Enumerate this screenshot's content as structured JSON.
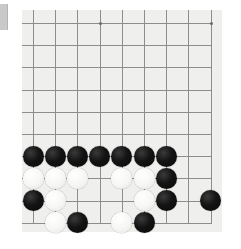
{
  "app": {
    "title": "Go board position",
    "kind": "go-board-image"
  },
  "edge_mark": {
    "name": "left-edge-marker",
    "color": "#c9c9c9"
  },
  "board": {
    "background_color": "#efefed",
    "page_background_color": "#ffffff",
    "line_color": "#8d8d8d",
    "star_point_color": "#6b6b6b",
    "origin_x": 22,
    "origin_y": 10,
    "width": 200,
    "height": 222,
    "grid_spacing": 22.2,
    "first_line_x": 11,
    "first_line_y": 13,
    "columns": 9,
    "rows": 10,
    "stone_diameter": 21,
    "star_points": [
      {
        "col": 3,
        "row": 0
      },
      {
        "col": 8,
        "row": 0
      }
    ]
  },
  "stones": {
    "black_label": "black",
    "white_label": "white",
    "list": [
      {
        "color": "black",
        "col": 0,
        "row": 6
      },
      {
        "color": "black",
        "col": 1,
        "row": 6
      },
      {
        "color": "black",
        "col": 2,
        "row": 6
      },
      {
        "color": "black",
        "col": 3,
        "row": 6
      },
      {
        "color": "black",
        "col": 4,
        "row": 6
      },
      {
        "color": "black",
        "col": 5,
        "row": 6
      },
      {
        "color": "black",
        "col": 6,
        "row": 6
      },
      {
        "color": "white",
        "col": 0,
        "row": 7
      },
      {
        "color": "white",
        "col": 1,
        "row": 7
      },
      {
        "color": "white",
        "col": 2,
        "row": 7
      },
      {
        "color": "white",
        "col": 4,
        "row": 7
      },
      {
        "color": "white",
        "col": 5,
        "row": 7
      },
      {
        "color": "black",
        "col": 6,
        "row": 7
      },
      {
        "color": "black",
        "col": 0,
        "row": 8
      },
      {
        "color": "white",
        "col": 1,
        "row": 8
      },
      {
        "color": "white",
        "col": 5,
        "row": 8
      },
      {
        "color": "black",
        "col": 6,
        "row": 8
      },
      {
        "color": "black",
        "col": 8,
        "row": 8
      },
      {
        "color": "white",
        "col": 1,
        "row": 9
      },
      {
        "color": "black",
        "col": 2,
        "row": 9
      },
      {
        "color": "white",
        "col": 4,
        "row": 9
      },
      {
        "color": "black",
        "col": 5,
        "row": 9
      }
    ],
    "counts": {
      "black": 14,
      "white": 8,
      "total": 22
    }
  }
}
